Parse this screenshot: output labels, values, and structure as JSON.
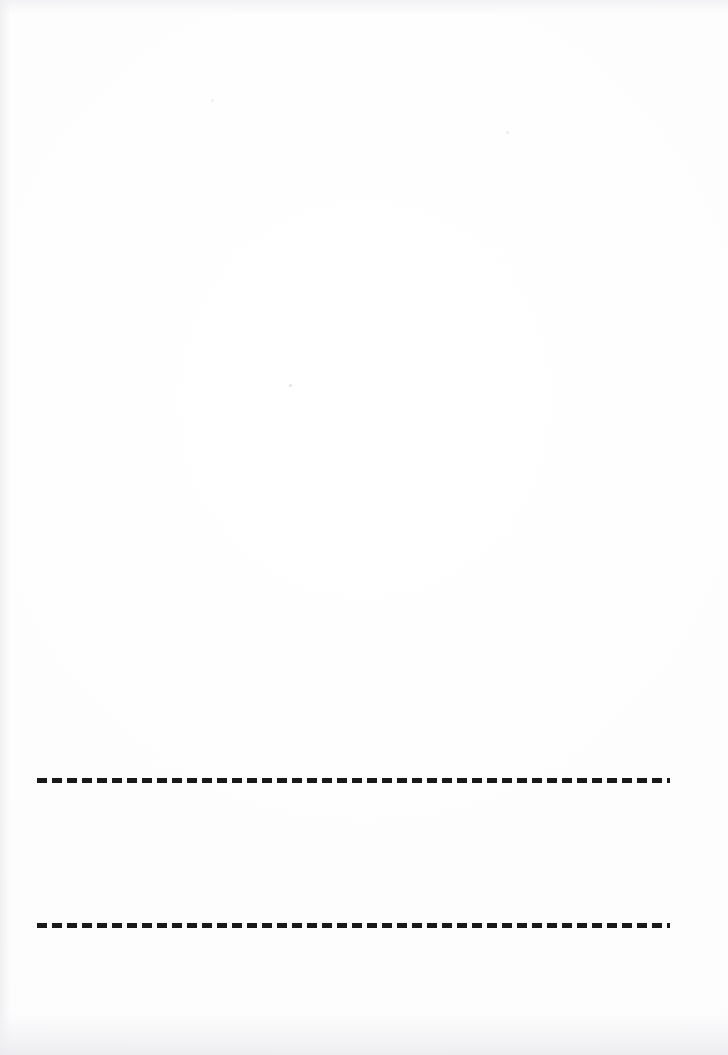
{
  "document": {
    "kind": "scanned-page",
    "page_width": 728,
    "page_height": 1055,
    "background_color": "#fdfdfd",
    "ink_color": "#191919",
    "visible_text": "",
    "description": "Blank scanned document page with two horizontal dashed fill-in rules in the lower third."
  },
  "rules": [
    {
      "name": "upper-dashed-rule",
      "left": 37,
      "top": 778,
      "width": 633,
      "height": 5,
      "dash_length": 10,
      "gap_length": 5,
      "color": "#191919",
      "label": ""
    },
    {
      "name": "lower-dashed-rule",
      "left": 37,
      "top": 923,
      "width": 633,
      "height": 5,
      "dash_length": 10,
      "gap_length": 5,
      "color": "#191919",
      "label": ""
    }
  ],
  "specks": [
    {
      "left": 289,
      "top": 384
    },
    {
      "left": 506,
      "top": 131
    },
    {
      "left": 211,
      "top": 99
    }
  ]
}
